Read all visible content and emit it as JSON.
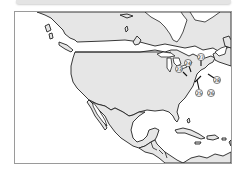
{
  "map": {
    "region": "North America and Caribbean",
    "land_color": "#e6e6e6",
    "water_color": "#ffffff",
    "outline_color": "#222222",
    "frame_color": "#9a9a9a"
  },
  "markers": [
    {
      "id": "23",
      "label": "23",
      "cx": 164,
      "cy": 57,
      "tx": 170,
      "ty": 64
    },
    {
      "id": "24",
      "label": "24",
      "cx": 173,
      "cy": 51,
      "tx": 175,
      "ty": 59
    },
    {
      "id": "25",
      "label": "25",
      "cx": 184,
      "cy": 81,
      "tx": 182,
      "ty": 70
    },
    {
      "id": "26",
      "label": "26",
      "cx": 196,
      "cy": 81,
      "tx": null,
      "ty": null
    },
    {
      "id": "27",
      "label": "27",
      "cx": 186,
      "cy": 45,
      "tx": 186,
      "ty": 52
    },
    {
      "id": "28",
      "label": "28",
      "cx": 202,
      "cy": 68,
      "tx": 194,
      "ty": 62
    }
  ]
}
